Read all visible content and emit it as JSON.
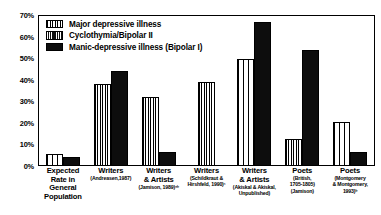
{
  "chart_data": {
    "type": "bar",
    "title": "",
    "xlabel": "",
    "ylabel": "",
    "ylim": [
      0,
      70
    ],
    "grid": false,
    "legend_position": "top-left",
    "ytick_labels": [
      "70%",
      "60%",
      "50%",
      "40%",
      "30%",
      "20%",
      "10%",
      "0%"
    ],
    "ytick_values": [
      70,
      60,
      50,
      40,
      30,
      20,
      10,
      0
    ],
    "categories": [
      "Expected Rate in General Population",
      "Writers (Andreasen, 1987)",
      "Writers & Artists (Jamison, 1989)",
      "Writers (Schildkraut & Hirshfeld, 1990)",
      "Writers & Artists (Akiskal & Akiskal, Unpublished)",
      "Poets (British, 1705-1805) (Jamison)",
      "Poets (Montgomery & Montgomery, 1993)"
    ],
    "series": [
      {
        "name": "Major depressive illness",
        "values": [
          5,
          38,
          32,
          39,
          50,
          12,
          20
        ]
      },
      {
        "name": "Cyclothymia/Bipolar II",
        "values": [
          null,
          null,
          null,
          null,
          null,
          null,
          null
        ]
      },
      {
        "name": "Manic-depressive illness (Bipolar I)",
        "values": [
          4,
          44,
          6,
          null,
          67,
          54,
          6
        ]
      }
    ]
  },
  "legend": {
    "items": [
      {
        "label": "Major depressive illness",
        "swatch": "major-depressive-swatch"
      },
      {
        "label": "Cyclothymia/Bipolar II",
        "swatch": "cyclothymia-swatch"
      },
      {
        "label": "Manic-depressive illness (Bipolar I)",
        "swatch": "manic-depressive-swatch"
      }
    ]
  },
  "x_axis": {
    "groups": [
      {
        "line1": "Expected",
        "line2": "Rate in",
        "line3": "General",
        "line4": "Population"
      },
      {
        "line1": "Writers",
        "line2": "(Andreasen,1987)",
        "line3": "",
        "line4": ""
      },
      {
        "line1": "Writers",
        "line2": "& Artists",
        "line3": "(Jamison, 1989)ᵃᵇ",
        "line4": ""
      },
      {
        "line1": "Writers",
        "line2": "(Schildkraut &",
        "line3": "Hirshfeld, 1990)ᶜ",
        "line4": ""
      },
      {
        "line1": "Writers",
        "line2": "& Artists",
        "line3": "(Akiskal & Akiskal,",
        "line4": "Unpublished)"
      },
      {
        "line1": "Poets",
        "line2": "(British,",
        "line3": "1705-1805)",
        "line4": "(Jamison)"
      },
      {
        "line1": "Poets",
        "line2": "(Montgomery",
        "line3": "& Montgomery,",
        "line4": "1993)ᵇ"
      }
    ]
  },
  "colors": {
    "axis": "#000000",
    "bar_fill_dark": "#0d0d0d",
    "background": "#ffffff"
  }
}
